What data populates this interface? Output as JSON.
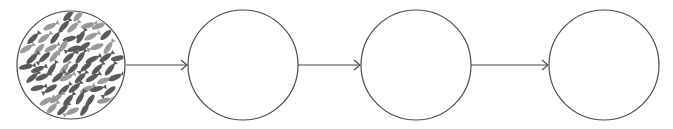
{
  "diagram": {
    "type": "process-flow",
    "stroke_color": "#4a4a4a",
    "fish_colors": {
      "dark": "#5a5a5a",
      "light": "#9a9a9a"
    },
    "circles": [
      {
        "id": "stage-1",
        "cx": 71,
        "cy": 65,
        "r": 54,
        "content": "school-of-fish"
      },
      {
        "id": "stage-2",
        "cx": 243,
        "cy": 65,
        "r": 55,
        "content": "empty"
      },
      {
        "id": "stage-3",
        "cx": 416,
        "cy": 65,
        "r": 55,
        "content": "empty"
      },
      {
        "id": "stage-4",
        "cx": 604,
        "cy": 65,
        "r": 55,
        "content": "empty"
      }
    ],
    "arrows": [
      {
        "from": "stage-1",
        "to": "stage-2",
        "x1": 126,
        "x2": 187,
        "y": 65
      },
      {
        "from": "stage-2",
        "to": "stage-3",
        "x1": 298,
        "x2": 360,
        "y": 65
      },
      {
        "from": "stage-3",
        "to": "stage-4",
        "x1": 471,
        "x2": 548,
        "y": 65
      }
    ]
  }
}
